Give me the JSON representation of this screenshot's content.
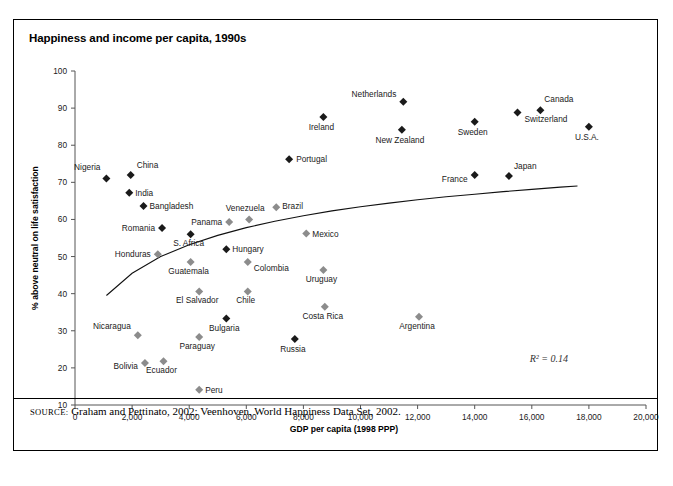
{
  "figure": {
    "title": "Happiness and income per capita, 1990s",
    "source_prefix": "SOURCE:",
    "source_text": " Graham and Pettinato, 2002; Veenhoven, World Happiness Data Set, 2002.",
    "annotation": "R² = 0.14"
  },
  "chart_data": {
    "type": "scatter",
    "title": "Happiness and income per capita, 1990s",
    "xlabel": "GDP per capita (1998 PPP)",
    "ylabel": "% above neutral on life satisfaction",
    "xlim": [
      0,
      20000
    ],
    "ylim": [
      10,
      100
    ],
    "xticks": [
      0,
      2000,
      4000,
      6000,
      8000,
      10000,
      12000,
      14000,
      16000,
      18000,
      20000
    ],
    "xticklabels": [
      "0",
      "2,000",
      "4,000",
      "6,000",
      "8,000",
      "10,000",
      "12,000",
      "14,000",
      "16,000",
      "18,000",
      "20,000"
    ],
    "yticks": [
      10,
      20,
      30,
      40,
      50,
      60,
      70,
      80,
      90,
      100
    ],
    "yticklabels": [
      "10",
      "20",
      "30",
      "40",
      "50",
      "60",
      "70",
      "80",
      "90",
      "100"
    ],
    "grid": false,
    "legend": false,
    "annotations": [
      {
        "text": "R² = 0.14",
        "x": 16600,
        "y": 21.5
      }
    ],
    "marker_styles": {
      "dark": "#1a1a1a",
      "light": "#8c8c8c"
    },
    "trendline": {
      "type": "logarithmic",
      "description": "fitted log curve rising from ~40% at low income to ~69% at high income",
      "points": [
        {
          "x": 1100,
          "y": 39.5
        },
        {
          "x": 2000,
          "y": 45.5
        },
        {
          "x": 3000,
          "y": 50.0
        },
        {
          "x": 4000,
          "y": 53.2
        },
        {
          "x": 5000,
          "y": 55.7
        },
        {
          "x": 6000,
          "y": 57.8
        },
        {
          "x": 7000,
          "y": 59.5
        },
        {
          "x": 8000,
          "y": 61.0
        },
        {
          "x": 9000,
          "y": 62.3
        },
        {
          "x": 10000,
          "y": 63.4
        },
        {
          "x": 11000,
          "y": 64.4
        },
        {
          "x": 12000,
          "y": 65.3
        },
        {
          "x": 13000,
          "y": 66.1
        },
        {
          "x": 14000,
          "y": 66.8
        },
        {
          "x": 15000,
          "y": 67.5
        },
        {
          "x": 16000,
          "y": 68.1
        },
        {
          "x": 17000,
          "y": 68.7
        },
        {
          "x": 17600,
          "y": 69.0
        }
      ]
    },
    "points": [
      {
        "label": "Nigeria",
        "x": 1100,
        "y": 71.0,
        "style": "dark",
        "lx": -6,
        "ly": -9,
        "anchor": "end"
      },
      {
        "label": "China",
        "x": 1950,
        "y": 72.0,
        "style": "dark",
        "lx": 6,
        "ly": -7,
        "anchor": "start"
      },
      {
        "label": "India",
        "x": 1900,
        "y": 67.2,
        "style": "dark",
        "lx": 6,
        "ly": 3,
        "anchor": "start"
      },
      {
        "label": "Bangladesh",
        "x": 2400,
        "y": 63.6,
        "style": "dark",
        "lx": 6,
        "ly": 3,
        "anchor": "start"
      },
      {
        "label": "Romania",
        "x": 3050,
        "y": 57.7,
        "style": "dark",
        "lx": -7,
        "ly": 3,
        "anchor": "end"
      },
      {
        "label": "S. Africa",
        "x": 4050,
        "y": 56.0,
        "style": "dark",
        "lx": -2,
        "ly": 12,
        "anchor": "middle"
      },
      {
        "label": "Honduras",
        "x": 2900,
        "y": 50.6,
        "style": "light",
        "lx": -7,
        "ly": 3,
        "anchor": "end"
      },
      {
        "label": "Guatemala",
        "x": 4050,
        "y": 48.5,
        "style": "light",
        "lx": -2,
        "ly": 12,
        "anchor": "middle"
      },
      {
        "label": "Hungary",
        "x": 5300,
        "y": 52.0,
        "style": "dark",
        "lx": 6,
        "ly": 3,
        "anchor": "start"
      },
      {
        "label": "Colombia",
        "x": 6050,
        "y": 48.5,
        "style": "light",
        "lx": 6,
        "ly": 9,
        "anchor": "start"
      },
      {
        "label": "Panama",
        "x": 5400,
        "y": 59.3,
        "style": "light",
        "lx": -7,
        "ly": 3,
        "anchor": "end"
      },
      {
        "label": "Venezuela",
        "x": 6100,
        "y": 60.0,
        "style": "light",
        "lx": -4,
        "ly": -8,
        "anchor": "middle"
      },
      {
        "label": "Brazil",
        "x": 7050,
        "y": 63.3,
        "style": "light",
        "lx": 6,
        "ly": 2,
        "anchor": "start"
      },
      {
        "label": "Mexico",
        "x": 8100,
        "y": 56.2,
        "style": "light",
        "lx": 6,
        "ly": 3,
        "anchor": "start"
      },
      {
        "label": "Uruguay",
        "x": 8700,
        "y": 46.4,
        "style": "light",
        "lx": -2,
        "ly": 12,
        "anchor": "middle"
      },
      {
        "label": "Costa Rica",
        "x": 8750,
        "y": 36.5,
        "style": "light",
        "lx": -2,
        "ly": 12,
        "anchor": "middle"
      },
      {
        "label": "El Salvador",
        "x": 4350,
        "y": 40.6,
        "style": "light",
        "lx": -2,
        "ly": 12,
        "anchor": "middle"
      },
      {
        "label": "Chile",
        "x": 6050,
        "y": 40.6,
        "style": "light",
        "lx": -2,
        "ly": 12,
        "anchor": "middle"
      },
      {
        "label": "Bulgaria",
        "x": 5300,
        "y": 33.3,
        "style": "dark",
        "lx": -2,
        "ly": 12,
        "anchor": "middle"
      },
      {
        "label": "Paraguay",
        "x": 4350,
        "y": 28.3,
        "style": "light",
        "lx": -2,
        "ly": 12,
        "anchor": "middle"
      },
      {
        "label": "Nicaragua",
        "x": 2200,
        "y": 28.8,
        "style": "light",
        "lx": -7,
        "ly": -6,
        "anchor": "end"
      },
      {
        "label": "Bolivia",
        "x": 2450,
        "y": 21.3,
        "style": "light",
        "lx": -7,
        "ly": 6,
        "anchor": "end"
      },
      {
        "label": "Ecuador",
        "x": 3100,
        "y": 21.8,
        "style": "light",
        "lx": -2,
        "ly": 12,
        "anchor": "middle"
      },
      {
        "label": "Peru",
        "x": 4350,
        "y": 14.1,
        "style": "light",
        "lx": 6,
        "ly": 3,
        "anchor": "start"
      },
      {
        "label": "Russia",
        "x": 7700,
        "y": 27.8,
        "style": "dark",
        "lx": -2,
        "ly": 13,
        "anchor": "middle"
      },
      {
        "label": "Argentina",
        "x": 12050,
        "y": 33.8,
        "style": "light",
        "lx": -2,
        "ly": 12,
        "anchor": "middle"
      },
      {
        "label": "Portugal",
        "x": 7500,
        "y": 76.2,
        "style": "dark",
        "lx": 7,
        "ly": 3,
        "anchor": "start"
      },
      {
        "label": "Ireland",
        "x": 8700,
        "y": 87.6,
        "style": "dark",
        "lx": -2,
        "ly": 13,
        "anchor": "middle"
      },
      {
        "label": "Netherlands",
        "x": 11500,
        "y": 91.7,
        "style": "dark",
        "lx": -7,
        "ly": -5,
        "anchor": "end"
      },
      {
        "label": "New Zealand",
        "x": 11450,
        "y": 84.2,
        "style": "dark",
        "lx": -2,
        "ly": 13,
        "anchor": "middle"
      },
      {
        "label": "Sweden",
        "x": 14000,
        "y": 86.3,
        "style": "dark",
        "lx": -2,
        "ly": 13,
        "anchor": "middle"
      },
      {
        "label": "Switzerland",
        "x": 15500,
        "y": 88.8,
        "style": "dark",
        "lx": 7,
        "ly": 9,
        "anchor": "start"
      },
      {
        "label": "Canada",
        "x": 16300,
        "y": 89.4,
        "style": "dark",
        "lx": 4,
        "ly": -8,
        "anchor": "start"
      },
      {
        "label": "U.S.A.",
        "x": 18000,
        "y": 85.0,
        "style": "dark",
        "lx": -2,
        "ly": 13,
        "anchor": "middle"
      },
      {
        "label": "France",
        "x": 14000,
        "y": 72.0,
        "style": "dark",
        "lx": -7,
        "ly": 7,
        "anchor": "end"
      },
      {
        "label": "Japan",
        "x": 15200,
        "y": 71.7,
        "style": "dark",
        "lx": 5,
        "ly": -7,
        "anchor": "start"
      }
    ]
  }
}
